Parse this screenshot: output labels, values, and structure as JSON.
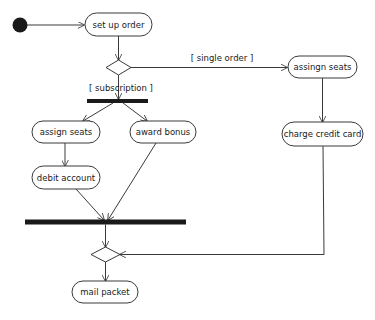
{
  "diagram": {
    "type": "uml-activity",
    "colors": {
      "stroke": "#3a3a3a",
      "fill": "#ffffff",
      "bar": "#1a1a1a",
      "initial": "#1a1a1a",
      "text": "#1a1a1a"
    },
    "nodes": {
      "initial": {
        "kind": "initial-node"
      },
      "set_up_order": {
        "label": "set up order"
      },
      "decision": {
        "kind": "decision-node"
      },
      "fork": {
        "kind": "fork-bar"
      },
      "assign_seats": {
        "label": "assign seats"
      },
      "award_bonus": {
        "label": "award bonus"
      },
      "debit_account": {
        "label": "debit account"
      },
      "assingn_seats": {
        "label": "assingn seats"
      },
      "charge_credit_card": {
        "label": "charge credit card"
      },
      "join": {
        "kind": "join-bar"
      },
      "merge": {
        "kind": "merge-node"
      },
      "mail_packet": {
        "label": "mail packet"
      }
    },
    "guards": {
      "single_order": "[ single order ]",
      "subscription": "[ subscription ]"
    },
    "edges": [
      {
        "from": "initial",
        "to": "set_up_order"
      },
      {
        "from": "set_up_order",
        "to": "decision"
      },
      {
        "from": "decision",
        "to": "assingn_seats",
        "guard": "[ single order ]"
      },
      {
        "from": "decision",
        "to": "fork",
        "guard": "[ subscription ]"
      },
      {
        "from": "fork",
        "to": "assign_seats"
      },
      {
        "from": "fork",
        "to": "award_bonus"
      },
      {
        "from": "assign_seats",
        "to": "debit_account"
      },
      {
        "from": "debit_account",
        "to": "join"
      },
      {
        "from": "award_bonus",
        "to": "join"
      },
      {
        "from": "assingn_seats",
        "to": "charge_credit_card"
      },
      {
        "from": "charge_credit_card",
        "to": "merge"
      },
      {
        "from": "join",
        "to": "merge"
      },
      {
        "from": "merge",
        "to": "mail_packet"
      }
    ]
  }
}
